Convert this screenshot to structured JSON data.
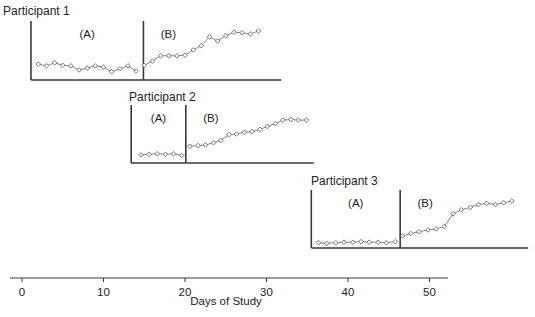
{
  "chart_data": {
    "type": "line",
    "subtype": "multiple-baseline single-subject design",
    "title": "",
    "xlabel": "Days of Study",
    "ylabel": "",
    "x_ticks": [
      0,
      10,
      20,
      30,
      40,
      50
    ],
    "xlim": [
      -1.5,
      52
    ],
    "grid": false,
    "legend": null,
    "y_scale_note": "Unlabeled y-axis; values estimated on 0-10 relative scale per panel (0 = baseline axis, 10 = top of y-axis)",
    "panels": [
      {
        "label": "Participant 1",
        "phase_labels": [
          "(A)",
          "(B)"
        ],
        "phase_change_day": 14.9,
        "x_range": [
          1.1,
          31.8
        ],
        "series": [
          {
            "name": "(A)",
            "days": [
              2,
              3,
              4,
              5,
              6,
              7,
              8,
              9,
              10,
              11,
              12,
              13,
              14
            ],
            "values": [
              2.7,
              2.4,
              2.9,
              2.5,
              2.4,
              1.7,
              2.0,
              2.4,
              2.2,
              1.4,
              1.9,
              2.4,
              1.5
            ]
          },
          {
            "name": "(B)",
            "days": [
              15,
              16,
              17,
              18,
              19,
              20,
              21,
              22,
              23,
              24,
              25,
              26,
              27,
              28,
              29
            ],
            "values": [
              2.5,
              3.2,
              4.1,
              4.1,
              4.1,
              4.2,
              5.1,
              5.8,
              7.3,
              6.6,
              7.5,
              8.1,
              8.0,
              7.8,
              8.3
            ]
          }
        ]
      },
      {
        "label": "Participant 2",
        "phase_labels": [
          "(A)",
          "(B)"
        ],
        "phase_change_day": 20.1,
        "x_range": [
          13.4,
          35.8
        ],
        "series": [
          {
            "name": "(A)",
            "days": [
              14.6,
              15.6,
              16.6,
              17.6,
              18.6,
              19.6
            ],
            "values": [
              1.4,
              1.5,
              1.6,
              1.5,
              1.6,
              1.3
            ]
          },
          {
            "name": "(B)",
            "days": [
              20.6,
              21.6,
              22.5,
              23.5,
              24.4,
              25.4,
              26.3,
              27.3,
              28.2,
              29.2,
              30.1,
              31.1,
              32.0,
              33.0,
              33.9,
              34.9
            ],
            "values": [
              2.9,
              3.0,
              3.1,
              3.5,
              3.9,
              4.9,
              5.0,
              5.3,
              5.4,
              5.8,
              6.3,
              6.8,
              7.4,
              7.5,
              7.4,
              7.4
            ]
          }
        ]
      },
      {
        "label": "Participant 3",
        "phase_labels": [
          "(A)",
          "(B)"
        ],
        "phase_change_day": 46.4,
        "x_range": [
          35.5,
          62.1
        ],
        "series": [
          {
            "name": "(A)",
            "days": [
              36.4,
              37.4,
              38.5,
              39.5,
              40.6,
              41.6,
              42.6,
              43.7,
              44.7,
              45.8
            ],
            "values": [
              0.9,
              0.8,
              0.9,
              1.0,
              1.0,
              1.1,
              1.0,
              1.0,
              0.9,
              1.1
            ]
          },
          {
            "name": "(B)",
            "days": [
              46.7,
              47.7,
              48.7,
              49.8,
              50.8,
              51.8,
              52.9,
              53.9,
              55.0,
              56.0,
              57.0,
              58.1,
              59.1,
              60.1
            ],
            "values": [
              2.1,
              2.5,
              2.8,
              3.1,
              3.3,
              3.7,
              5.9,
              6.6,
              7.0,
              7.5,
              7.7,
              7.5,
              7.8,
              8.1
            ]
          }
        ]
      }
    ]
  },
  "panel_labels": [
    "Participant 1",
    "Participant 2",
    "Participant 3"
  ],
  "phase_a_label": "(A)",
  "phase_b_label": "(B)",
  "x_axis": {
    "label": "Days of Study",
    "ticks": [
      "0",
      "10",
      "20",
      "30",
      "40",
      "50"
    ]
  },
  "colors": {
    "axis": "#3a3a3a",
    "line": "#7a7a7a",
    "marker_stroke": "#555555",
    "marker_fill": "#ffffff",
    "text": "#222222"
  }
}
